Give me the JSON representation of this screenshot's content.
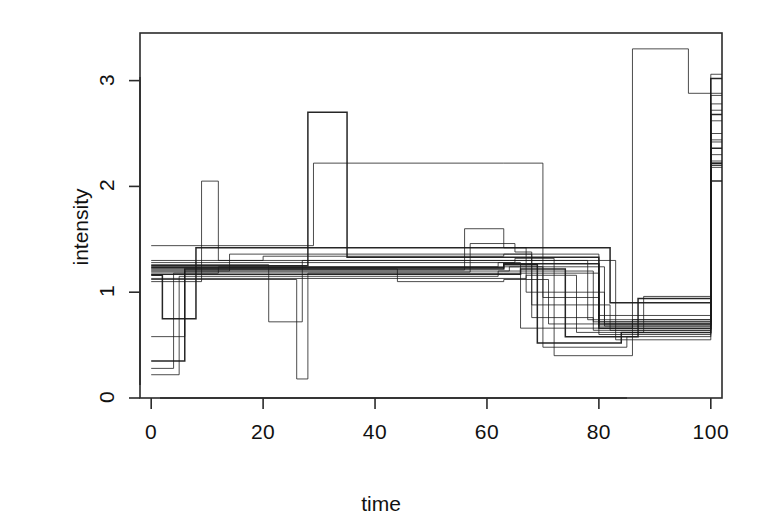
{
  "chart_data": {
    "type": "line",
    "line_style": "step",
    "title": "",
    "subtitle": "",
    "xlabel": "time",
    "ylabel": "intensity",
    "xlim": [
      -2,
      102
    ],
    "ylim": [
      0,
      3.45
    ],
    "xticks": [
      0,
      20,
      40,
      60,
      80,
      100
    ],
    "yticks": [
      0,
      1,
      2,
      3
    ],
    "xtick_labels": [
      "0",
      "20",
      "40",
      "60",
      "80",
      "100"
    ],
    "ytick_labels": [
      "0",
      "1",
      "2",
      "3"
    ],
    "grid": false,
    "legend": false,
    "legend_position": "none",
    "box": true,
    "line_color": "#1a1a1a",
    "background_color": "#ffffff",
    "n_series": 20,
    "series": [
      {
        "name": "trace-1",
        "x": [
          0,
          6,
          63,
          80,
          100
        ],
        "values": [
          0.35,
          1.22,
          1.27,
          0.7,
          2.22
        ]
      },
      {
        "name": "trace-2",
        "x": [
          0,
          5,
          62,
          79,
          100
        ],
        "values": [
          0.22,
          1.15,
          1.2,
          0.64,
          2.2
        ]
      },
      {
        "name": "trace-3",
        "x": [
          0,
          4,
          12,
          63,
          81,
          100
        ],
        "values": [
          0.28,
          1.18,
          1.24,
          1.24,
          0.68,
          2.24
        ]
      },
      {
        "name": "trace-4",
        "x": [
          0,
          9,
          12,
          64,
          78,
          100
        ],
        "values": [
          1.1,
          2.05,
          1.3,
          1.3,
          0.74,
          2.42
        ]
      },
      {
        "name": "trace-5",
        "x": [
          0,
          2,
          8,
          63,
          82,
          100
        ],
        "values": [
          1.16,
          0.75,
          1.42,
          1.42,
          0.9,
          2.05
        ]
      },
      {
        "name": "trace-6",
        "x": [
          0,
          6,
          14,
          64,
          80,
          100
        ],
        "values": [
          0.58,
          1.2,
          1.36,
          1.36,
          0.6,
          2.3
        ]
      },
      {
        "name": "trace-7",
        "x": [
          0,
          21,
          27,
          63,
          83,
          100
        ],
        "values": [
          1.26,
          0.72,
          1.3,
          1.3,
          0.55,
          2.5
        ]
      },
      {
        "name": "trace-8",
        "x": [
          0,
          26,
          28,
          63,
          80,
          100
        ],
        "values": [
          1.12,
          0.18,
          1.18,
          1.18,
          0.72,
          2.62
        ]
      },
      {
        "name": "trace-9",
        "x": [
          0,
          28,
          35,
          63,
          80,
          100
        ],
        "values": [
          1.25,
          2.7,
          1.33,
          1.33,
          0.66,
          2.68
        ]
      },
      {
        "name": "trace-10",
        "x": [
          0,
          29,
          63,
          70,
          80,
          100
        ],
        "values": [
          1.44,
          2.22,
          2.22,
          0.95,
          0.78,
          2.72
        ]
      },
      {
        "name": "trace-11",
        "x": [
          0,
          56,
          63,
          67,
          81,
          100
        ],
        "values": [
          1.21,
          1.6,
          1.42,
          1.0,
          0.7,
          2.78
        ]
      },
      {
        "name": "trace-12",
        "x": [
          0,
          57,
          65,
          68,
          82,
          100
        ],
        "values": [
          1.19,
          1.46,
          1.38,
          0.88,
          0.64,
          2.86
        ]
      },
      {
        "name": "trace-13",
        "x": [
          0,
          63,
          69,
          84,
          100
        ],
        "values": [
          1.23,
          1.26,
          0.52,
          0.62,
          3.02
        ]
      },
      {
        "name": "trace-14",
        "x": [
          0,
          64,
          70,
          85,
          100
        ],
        "values": [
          1.2,
          1.24,
          0.48,
          0.58,
          3.06
        ]
      },
      {
        "name": "trace-15",
        "x": [
          0,
          62,
          66,
          86,
          96,
          100
        ],
        "values": [
          1.24,
          1.28,
          0.66,
          3.3,
          2.88,
          2.88
        ]
      },
      {
        "name": "trace-16",
        "x": [
          0,
          65,
          72,
          86,
          100
        ],
        "values": [
          1.28,
          1.32,
          0.4,
          0.74,
          2.44
        ]
      },
      {
        "name": "trace-17",
        "x": [
          0,
          66,
          74,
          87,
          100
        ],
        "values": [
          1.17,
          1.22,
          0.58,
          0.94,
          2.36
        ]
      },
      {
        "name": "trace-18",
        "x": [
          0,
          67,
          76,
          88,
          100
        ],
        "values": [
          1.13,
          1.16,
          0.62,
          0.96,
          2.18
        ]
      },
      {
        "name": "trace-19",
        "x": [
          0,
          44,
          63,
          71,
          80,
          100
        ],
        "values": [
          1.22,
          1.1,
          1.12,
          0.7,
          0.68,
          2.2
        ]
      },
      {
        "name": "trace-20",
        "x": [
          0,
          20,
          63,
          68,
          79,
          100
        ],
        "values": [
          1.3,
          1.34,
          1.36,
          0.76,
          0.72,
          2.22
        ]
      }
    ],
    "annotations": [
      {
        "label": "baseline-level",
        "value": 1.22
      },
      {
        "label": "post-jump-band-low",
        "value": 2.05
      },
      {
        "label": "post-jump-band-high",
        "value": 3.3
      },
      {
        "label": "dip-band-low",
        "value": 0.4
      },
      {
        "label": "dip-band-high",
        "value": 1.0
      }
    ]
  },
  "axes": {
    "x_title": "time",
    "y_title": "intensity",
    "x_tick_labels": [
      "0",
      "20",
      "40",
      "60",
      "80",
      "100"
    ],
    "y_tick_labels": [
      "0",
      "1",
      "2",
      "3"
    ]
  }
}
